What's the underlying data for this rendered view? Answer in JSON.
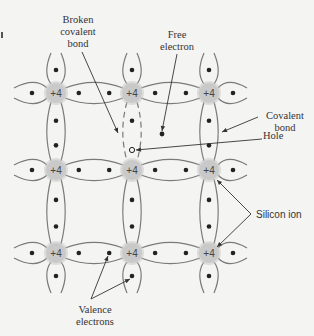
{
  "figure": {
    "ion_charge_label": "+4",
    "colors": {
      "background": "#f4f4f3",
      "bond_line": "#7a7a7a",
      "ion_fill": "#c9c9c9",
      "electron": "#222222",
      "leader": "#333333",
      "text": "#333333"
    }
  },
  "labels": {
    "broken_bond_line1": "Broken",
    "broken_bond_line2": "covalent",
    "broken_bond_line3": "bond",
    "free_electron_line1": "Free",
    "free_electron_line2": "electron",
    "covalent_bond_line1": "Covalent",
    "covalent_bond_line2": "bond",
    "hole": "Hole",
    "silicon_ion": "Silicon ion",
    "valence_line1": "Valence",
    "valence_line2": "electrons"
  },
  "lattice": {
    "columns_x": [
      56,
      132,
      209
    ],
    "rows_y": [
      93,
      170,
      253
    ],
    "ion_radius": 11,
    "broken_bond": {
      "from": [
        132,
        93
      ],
      "to": [
        132,
        170
      ]
    },
    "hole_position": [
      132,
      150
    ],
    "free_electron_position": [
      162,
      134
    ]
  }
}
